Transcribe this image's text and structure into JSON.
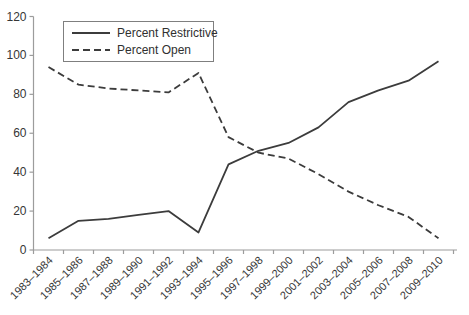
{
  "chart_data": {
    "type": "line",
    "title": "",
    "xlabel": "",
    "ylabel": "",
    "categories": [
      "1983–1984",
      "1985–1986",
      "1987–1988",
      "1989–1990",
      "1991–1992",
      "1993–1994",
      "1995–1996",
      "1997–1998",
      "1999–2000",
      "2001–2002",
      "2003–2004",
      "2005–2006",
      "2007–2008",
      "2009–2010"
    ],
    "series": [
      {
        "name": "Percent Restrictive",
        "line_style": "solid",
        "values": [
          6,
          15,
          16,
          18,
          20,
          9,
          44,
          51,
          55,
          63,
          76,
          82,
          87,
          97
        ]
      },
      {
        "name": "Percent Open",
        "line_style": "dashed",
        "values": [
          94,
          85,
          83,
          82,
          81,
          91,
          58,
          50,
          47,
          39,
          30,
          23,
          17,
          6
        ]
      }
    ],
    "ylim": [
      0,
      120
    ],
    "yticks": [
      0,
      20,
      40,
      60,
      80,
      100,
      120
    ],
    "grid": false,
    "legend_position": "top-left-inside",
    "colors": {
      "line": "#3c3c3c",
      "axis": "#9c9c9c",
      "text": "#363636",
      "background": "#ffffff",
      "legend_border": "#7f7f7f"
    }
  }
}
